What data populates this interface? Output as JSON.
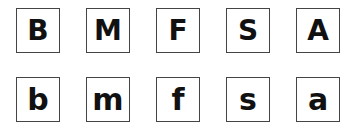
{
  "rows": [
    {
      "case": "uppercase",
      "letters": [
        "B",
        "M",
        "F",
        "S",
        "A"
      ]
    },
    {
      "case": "lowercase",
      "letters": [
        "b",
        "m",
        "f",
        "s",
        "a"
      ]
    }
  ],
  "colors": {
    "border": "#444444",
    "text": "#111111",
    "background": "#ffffff"
  }
}
